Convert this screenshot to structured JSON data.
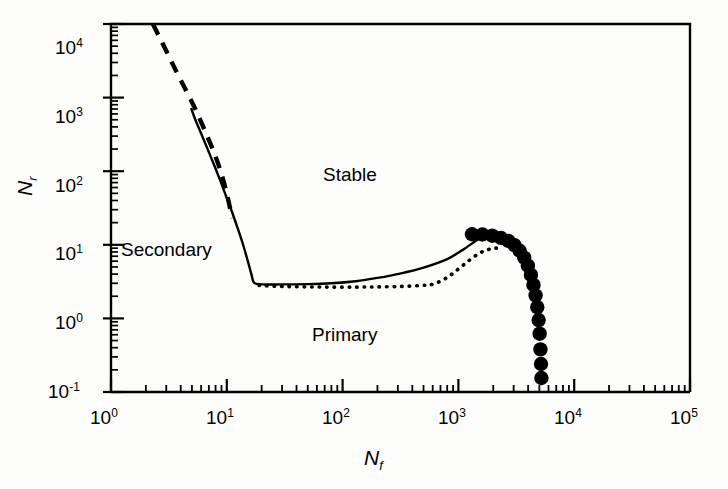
{
  "chart_data": {
    "type": "line",
    "title": "",
    "xlabel": "Nf",
    "ylabel": "Nr",
    "xscale": "log",
    "yscale": "log",
    "xlim": [
      1,
      100000
    ],
    "ylim": [
      0.1,
      10000
    ],
    "grid": false,
    "legend": null,
    "xtick_labels": [
      "10 0",
      "10 1",
      "10 2",
      "10 3",
      "10 4",
      "10 5"
    ],
    "xtick_values": [
      1,
      10,
      100,
      1000,
      10000,
      100000
    ],
    "ytick_labels": [
      "10 -1",
      "10 0",
      "10 1",
      "10 2",
      "10 3",
      "10 4"
    ],
    "ytick_values": [
      0.1,
      1,
      10,
      100,
      1000,
      10000
    ],
    "annotations": [
      {
        "text": "Stable",
        "x": 260,
        "y": 180
      },
      {
        "text": "Primary",
        "x": 210,
        "y": 0.62
      },
      {
        "text": "Secondary",
        "x": 1.6,
        "y": 9.5
      }
    ],
    "series": [
      {
        "name": "dashed-boundary",
        "style": "dashed",
        "points": [
          [
            2.3,
            10000
          ],
          [
            2.55,
            7200
          ],
          [
            2.85,
            5100
          ],
          [
            3.2,
            3500
          ],
          [
            3.6,
            2400
          ],
          [
            4.1,
            1600
          ],
          [
            4.7,
            1050
          ],
          [
            5.4,
            680
          ],
          [
            6.1,
            440
          ],
          [
            6.9,
            280
          ],
          [
            7.8,
            175
          ],
          [
            8.7,
            108
          ],
          [
            9.6,
            64
          ],
          [
            10.4,
            38
          ],
          [
            11.1,
            23
          ]
        ]
      },
      {
        "name": "solid-stability-boundary",
        "style": "solid",
        "points": [
          [
            4.95,
            700
          ],
          [
            5.3,
            520
          ],
          [
            5.8,
            370
          ],
          [
            6.4,
            255
          ],
          [
            7.1,
            172
          ],
          [
            7.9,
            114
          ],
          [
            8.8,
            74
          ],
          [
            9.8,
            47
          ],
          [
            11.0,
            29
          ],
          [
            12.3,
            17.5
          ],
          [
            13.7,
            10.5
          ],
          [
            15.1,
            6.2
          ],
          [
            16.3,
            4.0
          ],
          [
            17.2,
            3.05
          ],
          [
            20,
            2.9
          ],
          [
            30,
            2.9
          ],
          [
            50,
            2.92
          ],
          [
            80,
            3.0
          ],
          [
            130,
            3.2
          ],
          [
            200,
            3.55
          ],
          [
            320,
            4.1
          ],
          [
            500,
            4.9
          ],
          [
            800,
            6.4
          ],
          [
            1100,
            8.6
          ],
          [
            1400,
            11.2
          ],
          [
            1700,
            13.3
          ],
          [
            2000,
            13.9
          ],
          [
            2300,
            13.6
          ]
        ]
      },
      {
        "name": "dotted-boundary",
        "style": "dotted",
        "points": [
          [
            19,
            2.8
          ],
          [
            30,
            2.72
          ],
          [
            50,
            2.68
          ],
          [
            80,
            2.66
          ],
          [
            130,
            2.66
          ],
          [
            200,
            2.68
          ],
          [
            320,
            2.72
          ],
          [
            480,
            2.8
          ],
          [
            620,
            2.95
          ],
          [
            800,
            3.6
          ],
          [
            1000,
            4.7
          ],
          [
            1250,
            6.2
          ],
          [
            1500,
            7.6
          ],
          [
            1800,
            8.6
          ],
          [
            2100,
            9.0
          ],
          [
            2400,
            8.8
          ]
        ]
      },
      {
        "name": "filled-circle-markers",
        "style": "markers",
        "marker": "filled-circle",
        "points": [
          [
            1310,
            13.9
          ],
          [
            1610,
            13.8
          ],
          [
            1960,
            13.3
          ],
          [
            2330,
            12.4
          ],
          [
            2700,
            11.3
          ],
          [
            3050,
            9.9
          ],
          [
            3380,
            8.3
          ],
          [
            3700,
            6.7
          ],
          [
            3980,
            5.2
          ],
          [
            4230,
            3.9
          ],
          [
            4450,
            2.85
          ],
          [
            4640,
            2.05
          ],
          [
            4800,
            1.42
          ],
          [
            4930,
            0.95
          ],
          [
            5030,
            0.62
          ],
          [
            5110,
            0.38
          ],
          [
            5170,
            0.24
          ],
          [
            5210,
            0.155
          ]
        ]
      }
    ]
  },
  "axes": {
    "x_title": "N",
    "x_subscript": "f",
    "y_title": "N",
    "y_subscript": "r"
  },
  "ticks": {
    "x": [
      {
        "mantissa": "10",
        "exponent": "0"
      },
      {
        "mantissa": "10",
        "exponent": "1"
      },
      {
        "mantissa": "10",
        "exponent": "2"
      },
      {
        "mantissa": "10",
        "exponent": "3"
      },
      {
        "mantissa": "10",
        "exponent": "4"
      },
      {
        "mantissa": "10",
        "exponent": "5"
      }
    ],
    "y": [
      {
        "mantissa": "10",
        "exponent": "4"
      },
      {
        "mantissa": "10",
        "exponent": "3"
      },
      {
        "mantissa": "10",
        "exponent": "2"
      },
      {
        "mantissa": "10",
        "exponent": "1"
      },
      {
        "mantissa": "10",
        "exponent": "0"
      },
      {
        "mantissa": "10",
        "exponent": "-1"
      }
    ]
  },
  "regions": {
    "stable": "Stable",
    "primary": "Primary",
    "secondary": "Secondary"
  },
  "colors": {
    "line": "#000000",
    "background": "#fdfdfb",
    "text": "#000000"
  }
}
